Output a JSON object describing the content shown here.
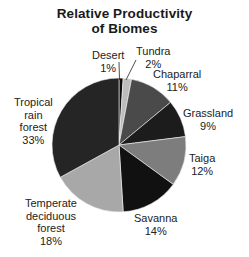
{
  "chart_data": {
    "type": "pie",
    "title": "Relative Productivity of Biomes",
    "title_lines": [
      "Relative Productivity",
      "of Biomes"
    ],
    "unit": "%",
    "slices": [
      {
        "label": "Desert",
        "value": 1,
        "color": "#0e0e0e"
      },
      {
        "label": "Tundra",
        "value": 2,
        "color": "#bdbdbd"
      },
      {
        "label": "Chaparral",
        "value": 11,
        "color": "#4a4a4a"
      },
      {
        "label": "Grassland",
        "value": 9,
        "color": "#1c1c1c"
      },
      {
        "label": "Taiga",
        "value": 12,
        "color": "#7d7d7d"
      },
      {
        "label": "Savanna",
        "value": 14,
        "color": "#111111"
      },
      {
        "label": "Temperate deciduous forest",
        "value": 18,
        "color": "#a8a8a8"
      },
      {
        "label": "Tropical rain forest",
        "value": 33,
        "color": "#252525"
      }
    ],
    "legend": "none (direct labels)"
  },
  "labels": {
    "desert": {
      "name": "Desert",
      "pct": "1%"
    },
    "tundra": {
      "name": "Tundra",
      "pct": "2%"
    },
    "chaparral": {
      "name": "Chaparral",
      "pct": "11%"
    },
    "grassland": {
      "name": "Grassland",
      "pct": "9%"
    },
    "taiga": {
      "name": "Taiga",
      "pct": "12%"
    },
    "savanna": {
      "name": "Savanna",
      "pct": "14%"
    },
    "temperate": {
      "lines": [
        "Temperate",
        "deciduous",
        "forest"
      ],
      "pct": "18%"
    },
    "tropical": {
      "lines": [
        "Tropical",
        "rain",
        "forest"
      ],
      "pct": "33%"
    }
  }
}
